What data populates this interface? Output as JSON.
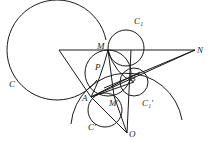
{
  "diagram": {
    "title": "",
    "stroke_color": "#1a1a1a",
    "labels": {
      "C": "C",
      "C1": "C₁",
      "M_top": "M",
      "N": "N",
      "P": "P",
      "A": "A",
      "B": "B",
      "M_bottom": "M′",
      "C1_prime": "C₁′",
      "C_prime": "C′",
      "O": "O"
    },
    "points": {
      "M": [
        108,
        50
      ],
      "N": [
        195,
        50
      ],
      "P": [
        104,
        70
      ],
      "A": [
        91,
        97
      ],
      "B": [
        134,
        82
      ],
      "Mp": [
        114,
        96
      ],
      "O": [
        127,
        133
      ],
      "L": [
        59,
        50
      ]
    },
    "circles": [
      {
        "name": "C",
        "cx": 57,
        "cy": 51,
        "r": 50
      },
      {
        "name": "C1",
        "cx": 126,
        "cy": 48,
        "r": 18
      },
      {
        "name": "circle-P",
        "cx": 108,
        "cy": 73,
        "r": 23
      },
      {
        "name": "C-prime",
        "cx": 105,
        "cy": 110,
        "r": 18
      },
      {
        "name": "C1-prime",
        "cx": 134,
        "cy": 82,
        "r": 16
      }
    ]
  }
}
